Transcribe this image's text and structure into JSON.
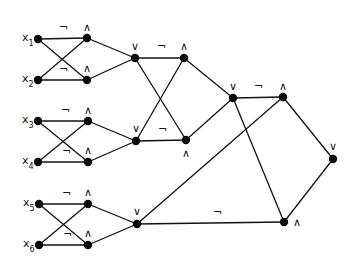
{
  "diagram": {
    "type": "boolean-circuit",
    "background": "#ffffff",
    "ink": "#111111",
    "inputs": [
      {
        "id": "x1",
        "label": "x",
        "sub": "1",
        "x": 38,
        "y": 39
      },
      {
        "id": "x2",
        "label": "x",
        "sub": "2",
        "x": 38,
        "y": 80
      },
      {
        "id": "x3",
        "label": "x",
        "sub": "3",
        "x": 38,
        "y": 121
      },
      {
        "id": "x4",
        "label": "x",
        "sub": "4",
        "x": 38,
        "y": 162
      },
      {
        "id": "x5",
        "label": "x",
        "sub": "5",
        "x": 39,
        "y": 204
      },
      {
        "id": "x6",
        "label": "x",
        "sub": "6",
        "x": 39,
        "y": 245
      }
    ],
    "gates": [
      {
        "id": "a1",
        "symbol": "∧",
        "x": 87,
        "y": 38,
        "lx": 83,
        "ly": 31
      },
      {
        "id": "a2",
        "symbol": "∧",
        "x": 87,
        "y": 80,
        "lx": 83,
        "ly": 72
      },
      {
        "id": "o1",
        "symbol": "∨",
        "x": 135,
        "y": 58,
        "lx": 131,
        "ly": 50
      },
      {
        "id": "a3",
        "symbol": "∧",
        "x": 88,
        "y": 121,
        "lx": 84,
        "ly": 114
      },
      {
        "id": "a4",
        "symbol": "∧",
        "x": 88,
        "y": 162,
        "lx": 84,
        "ly": 154
      },
      {
        "id": "o2",
        "symbol": "∨",
        "x": 136,
        "y": 141,
        "lx": 132,
        "ly": 132
      },
      {
        "id": "a5",
        "symbol": "∧",
        "x": 88,
        "y": 204,
        "lx": 84,
        "ly": 196
      },
      {
        "id": "a6",
        "symbol": "∧",
        "x": 88,
        "y": 245,
        "lx": 84,
        "ly": 237
      },
      {
        "id": "o3",
        "symbol": "∨",
        "x": 137,
        "y": 224,
        "lx": 133,
        "ly": 215
      },
      {
        "id": "a7",
        "symbol": "∧",
        "x": 184,
        "y": 58,
        "lx": 180,
        "ly": 50
      },
      {
        "id": "a8",
        "symbol": "∧",
        "x": 186,
        "y": 140,
        "lx": 182,
        "ly": 157
      },
      {
        "id": "o4",
        "symbol": "∨",
        "x": 233,
        "y": 98,
        "lx": 229,
        "ly": 90
      },
      {
        "id": "a9",
        "symbol": "∧",
        "x": 283,
        "y": 97,
        "lx": 279,
        "ly": 90
      },
      {
        "id": "o5",
        "symbol": "∨",
        "x": 333,
        "y": 159,
        "lx": 329,
        "ly": 150
      },
      {
        "id": "a10",
        "symbol": "∧",
        "x": 284,
        "y": 222,
        "lx": 293,
        "ly": 226
      }
    ],
    "edges": [
      {
        "from": "x1",
        "to": "a1",
        "negated": true,
        "nx": 59,
        "ny": 31
      },
      {
        "from": "x1",
        "to": "a2",
        "negated": false
      },
      {
        "from": "x2",
        "to": "a1",
        "negated": false
      },
      {
        "from": "x2",
        "to": "a2",
        "negated": true,
        "nx": 59,
        "ny": 73
      },
      {
        "from": "a1",
        "to": "o1",
        "negated": false
      },
      {
        "from": "a2",
        "to": "o1",
        "negated": false
      },
      {
        "from": "x3",
        "to": "a3",
        "negated": true,
        "nx": 61,
        "ny": 114
      },
      {
        "from": "x3",
        "to": "a4",
        "negated": false
      },
      {
        "from": "x4",
        "to": "a3",
        "negated": false
      },
      {
        "from": "x4",
        "to": "a4",
        "negated": true,
        "nx": 62,
        "ny": 155
      },
      {
        "from": "a3",
        "to": "o2",
        "negated": false
      },
      {
        "from": "a4",
        "to": "o2",
        "negated": false
      },
      {
        "from": "x5",
        "to": "a5",
        "negated": true,
        "nx": 62,
        "ny": 197
      },
      {
        "from": "x5",
        "to": "a6",
        "negated": false
      },
      {
        "from": "x6",
        "to": "a5",
        "negated": false
      },
      {
        "from": "x6",
        "to": "a6",
        "negated": true,
        "nx": 63,
        "ny": 238
      },
      {
        "from": "a5",
        "to": "o3",
        "negated": false
      },
      {
        "from": "a6",
        "to": "o3",
        "negated": false
      },
      {
        "from": "o1",
        "to": "a7",
        "negated": true,
        "nx": 157,
        "ny": 50
      },
      {
        "from": "o1",
        "to": "a8",
        "negated": false
      },
      {
        "from": "o2",
        "to": "a7",
        "negated": false
      },
      {
        "from": "o2",
        "to": "a8",
        "negated": true,
        "nx": 158,
        "ny": 133
      },
      {
        "from": "a7",
        "to": "o4",
        "negated": false
      },
      {
        "from": "a8",
        "to": "o4",
        "negated": false
      },
      {
        "from": "o4",
        "to": "a9",
        "negated": true,
        "nx": 254,
        "ny": 90
      },
      {
        "from": "o4",
        "to": "a10",
        "negated": false
      },
      {
        "from": "o3",
        "to": "a9",
        "negated": false
      },
      {
        "from": "o3",
        "to": "a10",
        "negated": true,
        "nx": 213,
        "ny": 216
      },
      {
        "from": "a9",
        "to": "o5",
        "negated": false
      },
      {
        "from": "a10",
        "to": "o5",
        "negated": false
      }
    ],
    "negation_symbol": "¬"
  }
}
